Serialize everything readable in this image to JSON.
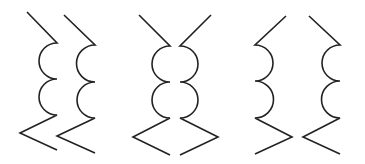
{
  "diagram": {
    "stroke_color": "#222222",
    "background": "#ffffff",
    "figures": [
      {
        "name": "figure-1-parallel",
        "paths": [
          "M27,12 L57,43 A18,18 0 0 0 57,79 A18,18 0 0 0 57,115 L20,133 L57,150",
          "M64,15 L95,45 A18.5,18.5 0 0 0 95,82 A18,18 0 0 0 95,118 L57,136 L95,153"
        ]
      },
      {
        "name": "figure-2-mirrored-outward",
        "paths": [
          "M139,15 L170,46 A18,18 0 0 0 170,82 A18,18 0 0 0 170,118 L133,137 L170,155",
          "M211,15 L180,46 A18,18 0 0 1 180,82 A18,18 0 0 1 180,118 L218,137 L180,155"
        ]
      },
      {
        "name": "figure-3-mirrored-inward",
        "paths": [
          "M286,16 L255,45 A18,18 0 0 1 255,81 A18.5,18.5 0 0 1 255,118 L292,137 L255,154",
          "M309,16 L340,45 A18,18 0 0 0 340,81 A18.5,18.5 0 0 0 340,118 L303,137 L340,154"
        ]
      }
    ]
  }
}
